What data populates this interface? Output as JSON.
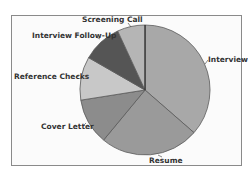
{
  "chart_data": {
    "type": "pie",
    "title": "",
    "start_angle_deg": 0,
    "direction": "clockwise",
    "slices": [
      {
        "label": "Interview",
        "value": 36.4,
        "color": "#a8a8a8"
      },
      {
        "label": "Resume",
        "value": 24.6,
        "color": "#9a9a9a"
      },
      {
        "label": "Cover Letter",
        "value": 11.5,
        "color": "#8c8c8c"
      },
      {
        "label": "Reference Checks",
        "value": 10.8,
        "color": "#c8c8c8"
      },
      {
        "label": "Interview Follow-Up",
        "value": 9.8,
        "color": "#555555"
      },
      {
        "label": "Screening Call",
        "value": 6.9,
        "color": "#b5b5b5"
      }
    ],
    "legend": "none",
    "data_labels": "category names outside with leader lines"
  },
  "labels": {
    "interview": "Interview",
    "resume": "Resume",
    "cover_letter": "Cover Letter",
    "reference_checks": "Reference Checks",
    "interview_follow_up": "Interview Follow-Up",
    "screening_call": "Screening Call"
  }
}
